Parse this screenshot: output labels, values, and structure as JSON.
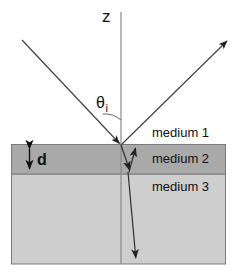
{
  "figure": {
    "type": "optics-ray-diagram",
    "background_color": "#ffffff",
    "width": 238,
    "height": 278
  },
  "axis": {
    "label": "z",
    "name": "normal-axis",
    "color": "#888888",
    "x": 121,
    "y_top": 12,
    "y_bottom": 264
  },
  "angle": {
    "symbol": "θ",
    "subscript": "i",
    "name": "angle-of-incidence",
    "arc_color": "#555555"
  },
  "thickness": {
    "label": "d",
    "name": "layer-thickness",
    "arrow_color": "#111111"
  },
  "media": [
    {
      "index": 1,
      "label": "medium 1",
      "fill": "#ffffff",
      "top": 0,
      "bottom": 144
    },
    {
      "index": 2,
      "label": "medium 2",
      "fill": "#a9a9a9",
      "top": 144,
      "bottom": 174
    },
    {
      "index": 3,
      "label": "medium 3",
      "fill": "#cecece",
      "top": 174,
      "bottom": 264
    }
  ],
  "slab": {
    "name": "layered-slab",
    "left": 11,
    "right": 226,
    "top": 144,
    "bottom": 264,
    "border_color": "#7a7a7a"
  },
  "rays": [
    {
      "name": "incident-ray",
      "from": [
        22,
        40
      ],
      "to": [
        121,
        145
      ],
      "arrow": true,
      "color": "#333333"
    },
    {
      "name": "reflected-ray",
      "from": [
        121,
        145
      ],
      "to": [
        228,
        40
      ],
      "arrow": true,
      "color": "#333333"
    },
    {
      "name": "refracted-ray-layer",
      "from": [
        121,
        145
      ],
      "to": [
        130,
        172
      ],
      "arrow": true,
      "color": "#333333"
    },
    {
      "name": "internally-reflected-ray",
      "from": [
        129,
        172
      ],
      "to": [
        136,
        146
      ],
      "arrow": true,
      "color": "#333333"
    },
    {
      "name": "transmitted-ray",
      "from": [
        128,
        172
      ],
      "to": [
        136,
        261
      ],
      "arrow": true,
      "color": "#333333"
    }
  ]
}
